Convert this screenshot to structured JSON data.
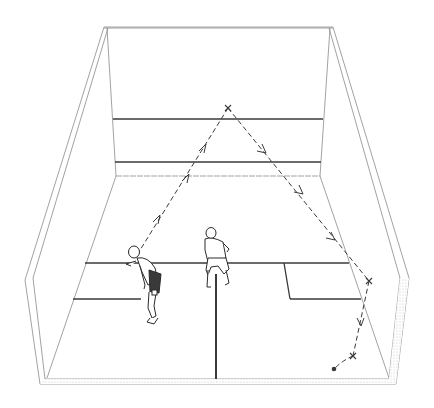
{
  "diagram": {
    "colors": {
      "background": "#ffffff",
      "wall_line": "#8a8a8a",
      "court_line": "#3a3a3a",
      "path": "#3a3a3a",
      "wall_texture": "#cfcfcf"
    },
    "elements": {
      "front_wall": "front-wall",
      "service_line": "front-wall-service-line",
      "tin_line": "front-wall-tin",
      "short_line": "floor-short-line",
      "half_court_line": "floor-half-court-line",
      "service_box_left": "left-service-box",
      "service_box_right": "right-service-box",
      "player_1": "player-hitting",
      "player_2": "player-waiting",
      "ball": "ball",
      "trajectory": "ball-trajectory"
    },
    "trajectory_points": [
      {
        "label": "strike",
        "x": 137,
        "y": 255
      },
      {
        "label": "front-wall-hit",
        "x": 228,
        "y": 108
      },
      {
        "label": "side-wall-hit",
        "x": 369,
        "y": 281
      },
      {
        "label": "floor-bounce",
        "x": 353,
        "y": 356
      },
      {
        "label": "ball-rest",
        "x": 334,
        "y": 369
      }
    ]
  }
}
